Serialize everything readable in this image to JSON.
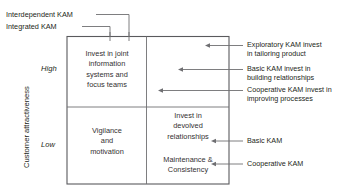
{
  "diagram": {
    "axis": {
      "y_title": "Customer attractiveness",
      "y_high": "High",
      "y_low": "Low"
    },
    "top_labels": [
      {
        "text": "Interdependent KAM"
      },
      {
        "text": "Integrated KAM"
      }
    ],
    "cells": [
      {
        "id": "top-left",
        "text": "Invest in joint\ninformation\nsystems and\nfocus teams"
      },
      {
        "id": "bottom-left",
        "text": "Vigilance\nand\nmotivation"
      },
      {
        "id": "bottom-right-upper",
        "text": "Invest in\ndevolved\nrelationships"
      },
      {
        "id": "bottom-right-lower",
        "text": "Maintenance &\nConsistency"
      }
    ],
    "right_labels": [
      {
        "text": "Exploratory KAM invest\nin tailoring product"
      },
      {
        "text": "Basic KAM invest in\nbuilding relationships"
      },
      {
        "text": "Cooperative KAM invest in\nimproving processes"
      },
      {
        "text": "Basic KAM"
      },
      {
        "text": "Cooperative KAM"
      }
    ],
    "colors": {
      "line": "#6f6f72",
      "border": "#5a5a5d",
      "text": "#231f20",
      "background": "#ffffff"
    }
  }
}
